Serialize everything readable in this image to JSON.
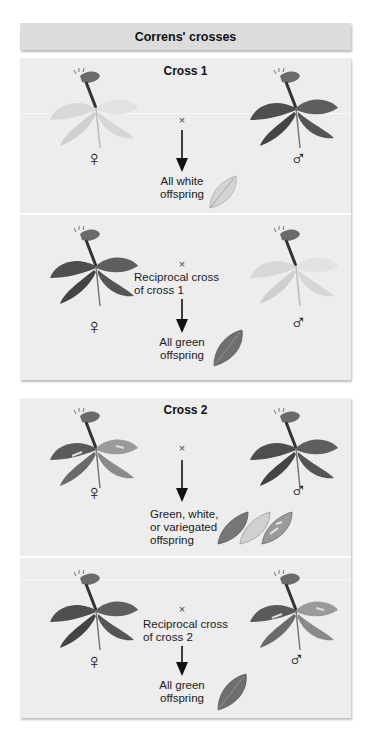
{
  "title": "Correns' crosses",
  "symbols": {
    "female": "♀",
    "male": "♂",
    "cross": "×"
  },
  "colors": {
    "header_bg": "#dcdcdc",
    "panel_bg": "#ededed",
    "divider": "#ffffff",
    "text": "#111111",
    "dark_leaf": "#555555",
    "white_leaf": "#d9d9d9",
    "variegated_leaf": "#8a8a8a"
  },
  "panels": [
    {
      "title": "Cross 1",
      "rows": [
        {
          "female_plant": "white-leaved plant",
          "male_plant": "green-leaved plant",
          "description": "",
          "result_line1": "All white",
          "result_line2": "offspring",
          "offspring_leaf": "white leaf"
        },
        {
          "female_plant": "green-leaved plant",
          "male_plant": "white-leaved plant",
          "description_line1": "Reciprocal cross",
          "description_line2": "of cross 1",
          "result_line1": "All green",
          "result_line2": "offspring",
          "offspring_leaf": "green leaf"
        }
      ]
    },
    {
      "title": "Cross 2",
      "rows": [
        {
          "female_plant": "variegated plant",
          "male_plant": "green-leaved plant",
          "description": "",
          "result_line1": "Green, white,",
          "result_line2": "or variegated",
          "result_line3": "offspring",
          "offspring_leaf": "green, white and variegated leaves"
        },
        {
          "female_plant": "green-leaved plant",
          "male_plant": "variegated plant",
          "description_line1": "Reciprocal cross",
          "description_line2": "of cross 2",
          "result_line1": "All green",
          "result_line2": "offspring",
          "offspring_leaf": "green leaf"
        }
      ]
    }
  ]
}
